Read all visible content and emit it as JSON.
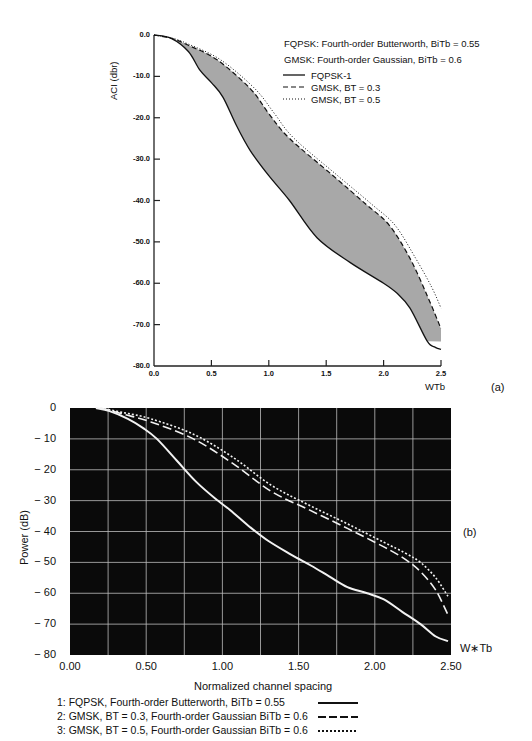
{
  "chart_data": [
    {
      "id": "a",
      "type": "line",
      "panel_label": "(a)",
      "title": "",
      "subtitle_lines": [
        "FQPSK: Fourth-order Butterworth, BiTb = 0.55",
        "GMSK: Fourth-order Gaussian, BiTb = 0.6"
      ],
      "xlabel": "WTb",
      "ylabel": "ACI (dbr)",
      "xlim": [
        0,
        2.5
      ],
      "ylim": [
        -80,
        0
      ],
      "x_ticks": [
        "0.0",
        "0.5",
        "1.0",
        "1.5",
        "2.0",
        "2.5"
      ],
      "y_ticks": [
        "0.0",
        "-10.0",
        "-20.0",
        "-30.0",
        "-40.0",
        "-50.0",
        "-60.0",
        "-70.0",
        "-80.0"
      ],
      "grid": false,
      "shaded_region": "between FQPSK-1 and GMSK, BT = 0.3",
      "legend": [
        {
          "label": "FQPSK-1",
          "style": "solid"
        },
        {
          "label": "GMSK, BT = 0.3",
          "style": "dashed"
        },
        {
          "label": "GMSK, BT = 0.5",
          "style": "dotted"
        }
      ],
      "series": [
        {
          "name": "FQPSK-1",
          "style": "solid",
          "x": [
            0,
            0.15,
            0.3,
            0.4,
            0.5,
            0.6,
            0.72,
            0.84,
            1.0,
            1.18,
            1.42,
            1.71,
            2.0,
            2.12,
            2.23,
            2.38,
            2.45,
            2.5
          ],
          "y": [
            0,
            -0.8,
            -4,
            -8.5,
            -11.5,
            -15,
            -22,
            -28,
            -34,
            -40,
            -49,
            -55,
            -60,
            -62.5,
            -66,
            -74,
            -75.5,
            -76
          ]
        },
        {
          "name": "GMSK, BT = 0.3",
          "style": "dashed",
          "x": [
            0,
            0.15,
            0.3,
            0.55,
            0.84,
            1.0,
            1.18,
            1.56,
            1.85,
            2.05,
            2.23,
            2.38,
            2.5
          ],
          "y": [
            0,
            -0.8,
            -2.5,
            -6,
            -13,
            -19,
            -25,
            -34,
            -41,
            -46,
            -54,
            -63,
            -71
          ]
        },
        {
          "name": "GMSK, BT = 0.5",
          "style": "dotted",
          "x": [
            0,
            0.15,
            0.3,
            0.58,
            0.88,
            1.05,
            1.22,
            1.6,
            1.9,
            2.1,
            2.28,
            2.42,
            2.5
          ],
          "y": [
            0,
            -0.7,
            -2.2,
            -6,
            -13,
            -19,
            -25,
            -34,
            -41,
            -46,
            -54,
            -61,
            -66
          ]
        }
      ]
    },
    {
      "id": "b",
      "type": "line",
      "panel_label": "(b)",
      "title": "",
      "xlabel": "Normalized channel spacing",
      "x_axis_end_label": "W∗Tb",
      "ylabel": "Power (dB)",
      "xlim": [
        0,
        2.5
      ],
      "ylim": [
        -80,
        0
      ],
      "x_ticks": [
        "0.00",
        "0.50",
        "1.00",
        "1.50",
        "2.00",
        "2.50"
      ],
      "y_ticks": [
        "0",
        "− 10",
        "− 20",
        "− 30",
        "− 40",
        "− 50",
        "− 60",
        "− 70",
        "− 80"
      ],
      "grid": true,
      "grid_x_step": 0.25,
      "grid_y_step": 10,
      "background": "#0a0a0a",
      "legend": [
        {
          "label": "1: FQPSK, Fourth-order Butterworth, BiTb = 0.55",
          "style": "solid"
        },
        {
          "label": "2: GMSK, BT = 0.3, Fourth-order Gaussian BiTb = 0.6",
          "style": "dashed"
        },
        {
          "label": "3: GMSK, BT = 0.5, Fourth-order Gaussian BiTb = 0.6",
          "style": "dotted"
        }
      ],
      "series": [
        {
          "name": "1: FQPSK",
          "style": "solid",
          "x": [
            0.17,
            0.26,
            0.38,
            0.48,
            0.57,
            0.7,
            0.83,
            0.97,
            1.05,
            1.18,
            1.3,
            1.45,
            1.58,
            1.7,
            1.82,
            1.95,
            2.06,
            2.18,
            2.3,
            2.4,
            2.48
          ],
          "y": [
            0,
            -1,
            -3.5,
            -6.5,
            -10,
            -17,
            -24,
            -30,
            -33,
            -38.5,
            -43,
            -47.5,
            -51,
            -54.5,
            -58,
            -60,
            -62,
            -66,
            -70,
            -74,
            -75.5
          ]
        },
        {
          "name": "2: GMSK, BT = 0.3",
          "style": "dashed",
          "x": [
            0.2,
            0.35,
            0.53,
            0.81,
            1.07,
            1.32,
            1.57,
            1.82,
            2.06,
            2.2,
            2.3,
            2.4,
            2.48
          ],
          "y": [
            0,
            -2,
            -4.5,
            -10,
            -18,
            -27,
            -33,
            -39,
            -45,
            -49,
            -53,
            -59,
            -67
          ]
        },
        {
          "name": "3: GMSK, BT = 0.5",
          "style": "dotted",
          "x": [
            0.2,
            0.35,
            0.53,
            0.81,
            1.07,
            1.32,
            1.57,
            1.82,
            2.06,
            2.2,
            2.3,
            2.4,
            2.48
          ],
          "y": [
            0,
            -1.5,
            -3.5,
            -8.5,
            -16,
            -25,
            -31.5,
            -37.5,
            -43.5,
            -47,
            -50,
            -55,
            -61
          ]
        }
      ]
    }
  ]
}
